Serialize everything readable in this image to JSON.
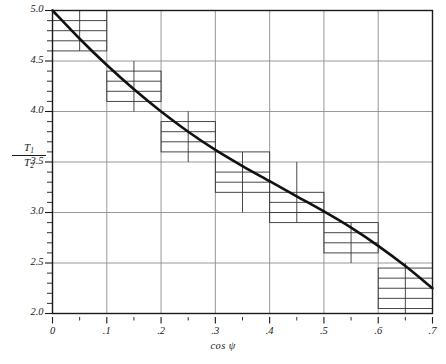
{
  "figure": {
    "background_color": "#ffffff",
    "frame_color": "#1a1a1a",
    "grid_color": "#8c8c8c",
    "curve_color": "#111111",
    "box_color": "#333333"
  },
  "axes": {
    "y_label_numerator": "T",
    "y_label_numerator_sub": "1",
    "y_label_denominator": "T",
    "y_label_denominator_sub": "2",
    "x_label": "cos ψ"
  },
  "chart_data": {
    "type": "line",
    "title": "",
    "xlabel": "cos ψ",
    "ylabel": "T1/T2",
    "xlim": [
      0,
      0.7
    ],
    "ylim": [
      2.0,
      5.0
    ],
    "grid": true,
    "legend": null,
    "x_major_ticks": [
      0,
      0.1,
      0.2,
      0.3,
      0.4,
      0.5,
      0.6,
      0.7
    ],
    "x_major_tick_labels": [
      "0",
      ".1",
      ".2",
      ".3",
      ".4",
      ".5",
      ".6",
      ".7"
    ],
    "x_minor_tick_step": 0.05,
    "y_major_ticks": [
      2.0,
      2.5,
      3.0,
      3.5,
      4.0,
      4.5,
      5.0
    ],
    "y_major_tick_labels": [
      "2.0",
      "2.5",
      "3.0",
      "3.5",
      "4.0",
      "4.5",
      "5.0"
    ],
    "y_minor_tick_step": 0.1,
    "series": [
      {
        "name": "fitted curve",
        "style": "solid",
        "x": [
          0.0,
          0.05,
          0.1,
          0.15,
          0.2,
          0.25,
          0.3,
          0.35,
          0.4,
          0.45,
          0.5,
          0.55,
          0.6,
          0.65,
          0.7
        ],
        "y": [
          5.0,
          4.72,
          4.46,
          4.22,
          4.0,
          3.8,
          3.62,
          3.46,
          3.31,
          3.16,
          3.01,
          2.85,
          2.67,
          2.47,
          2.25
        ]
      }
    ],
    "data_boxes": [
      {
        "x_min": 0.0,
        "x_max": 0.1,
        "x_center": 0.05,
        "y_min": 4.6,
        "y_max": 5.0,
        "hatch_lines_y": [
          4.7,
          4.8,
          4.9
        ]
      },
      {
        "x_min": 0.1,
        "x_max": 0.2,
        "x_center": 0.15,
        "y_min": 4.1,
        "y_max": 4.4,
        "hatch_lines_y": [
          4.2,
          4.3
        ]
      },
      {
        "x_min": 0.2,
        "x_max": 0.3,
        "x_center": 0.25,
        "y_min": 3.6,
        "y_max": 3.9,
        "hatch_lines_y": [
          3.7,
          3.8
        ]
      },
      {
        "x_min": 0.3,
        "x_max": 0.4,
        "x_center": 0.35,
        "y_min": 3.2,
        "y_max": 3.6,
        "hatch_lines_y": [
          3.3,
          3.4
        ]
      },
      {
        "x_min": 0.4,
        "x_max": 0.5,
        "x_center": 0.45,
        "y_min": 2.9,
        "y_max": 3.2,
        "hatch_lines_y": [
          3.0,
          3.1
        ]
      },
      {
        "x_min": 0.5,
        "x_max": 0.6,
        "x_center": 0.55,
        "y_min": 2.6,
        "y_max": 2.9,
        "hatch_lines_y": [
          2.7,
          2.8
        ]
      },
      {
        "x_min": 0.6,
        "x_max": 0.7,
        "x_center": 0.65,
        "y_min": 2.05,
        "y_max": 2.45,
        "hatch_lines_y": [
          2.15,
          2.25,
          2.35
        ]
      }
    ],
    "box_whisker_extents": [
      {
        "x_center": 0.05,
        "y_low": 4.6,
        "y_high": 5.0
      },
      {
        "x_center": 0.15,
        "y_low": 4.0,
        "y_high": 4.5
      },
      {
        "x_center": 0.25,
        "y_low": 3.5,
        "y_high": 4.0
      },
      {
        "x_center": 0.35,
        "y_low": 3.0,
        "y_high": 3.6
      },
      {
        "x_center": 0.45,
        "y_low": 2.9,
        "y_high": 3.5
      },
      {
        "x_center": 0.55,
        "y_low": 2.5,
        "y_high": 2.9
      },
      {
        "x_center": 0.65,
        "y_low": 2.0,
        "y_high": 2.5
      }
    ]
  }
}
